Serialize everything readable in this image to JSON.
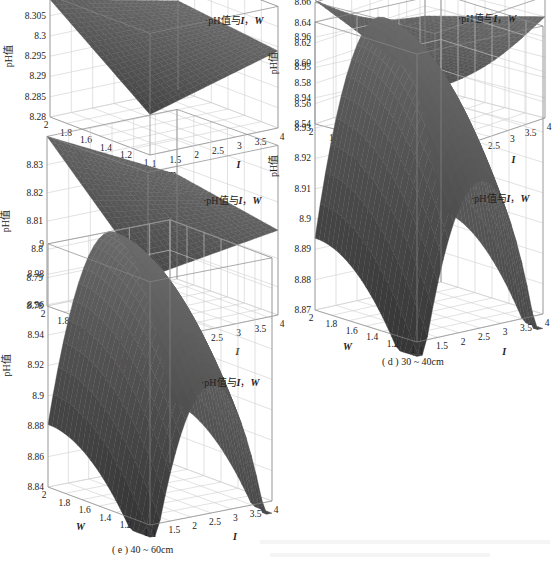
{
  "chart_data": [
    {
      "id": "a",
      "type": "surface3d",
      "caption": "( a ) 0 ~ 10cm",
      "legend": "pH值与I，W",
      "zlabel": "pH值",
      "xlabel": "I",
      "ylabel": "W",
      "x_ticks": [
        "1",
        "1.5",
        "2",
        "2.5",
        "3",
        "3.5",
        "4"
      ],
      "y_ticks": [
        "1",
        "1.2",
        "1.4",
        "1.6",
        "1.8",
        "2"
      ],
      "z_ticks": [
        "8.28",
        "8.285",
        "8.29",
        "8.295",
        "8.3",
        "8.305",
        "8.31"
      ],
      "xlim": [
        1,
        4
      ],
      "ylim": [
        1,
        2
      ],
      "zlim": [
        8.28,
        8.31
      ],
      "surface": "saddle-like, high at I=1,W=2 (~8.31), low near I=1,W=1 (~8.29), ~8.30 at I=4",
      "corner_values": {
        "I1_W2": 8.309,
        "I1_W1": 8.29,
        "I4_W2": 8.302,
        "I4_W1": 8.299
      },
      "shape": "bilinear"
    },
    {
      "id": "b",
      "type": "surface3d",
      "caption": "( b ) 10 ~ 20cm",
      "legend": "pH值与I，W",
      "zlabel": "pH值",
      "xlabel": "I",
      "ylabel": "W",
      "x_ticks": [
        "1",
        "1.5",
        "2",
        "2.5",
        "3",
        "3.5",
        "4"
      ],
      "y_ticks": [
        "1",
        "1.2",
        "1.4",
        "1.6",
        "1.8",
        "2"
      ],
      "z_ticks": [
        "8.54",
        "8.56",
        "8.58",
        "8.60",
        "8.62",
        "8.64",
        "8.66"
      ],
      "xlim": [
        1,
        4
      ],
      "ylim": [
        1,
        2
      ],
      "zlim": [
        8.54,
        8.66
      ],
      "surface": "concave trough, high at I=1,W=2 (~8.66), minimum ~8.60 near I=1,W=1, rising to ~8.64 at I=4",
      "corner_values": {
        "I1_W2": 8.662,
        "I1_W1": 8.605,
        "I4_W2": 8.61,
        "I4_W1": 8.64
      },
      "shape": "bowl"
    },
    {
      "id": "c",
      "type": "surface3d",
      "caption": "( c ) 20 ~ 30cm",
      "legend": "pH值与I，W",
      "zlabel": "pH值",
      "xlabel": "I",
      "ylabel": "W",
      "x_ticks": [
        "1",
        "1.5",
        "2",
        "2.5",
        "3",
        "3.5",
        "4"
      ],
      "y_ticks": [
        "1",
        "1.2",
        "1.4",
        "1.6",
        "1.8",
        "2"
      ],
      "z_ticks": [
        "8.78",
        "8.79",
        "8.8",
        "8.81",
        "8.82",
        "8.83"
      ],
      "xlim": [
        1,
        4
      ],
      "ylim": [
        1,
        2
      ],
      "zlim": [
        8.78,
        8.84
      ],
      "surface": "saddle-like, high at I=1,W=2 (~8.84), low ~8.80 mid, ~8.815 at I=4",
      "corner_values": {
        "I1_W2": 8.84,
        "I1_W1": 8.803,
        "I4_W2": 8.817,
        "I4_W1": 8.81
      },
      "shape": "bilinear"
    },
    {
      "id": "d",
      "type": "surface3d",
      "caption": "( d ) 30 ~ 40cm",
      "legend": "pH值与I，W",
      "zlabel": "pH值",
      "xlabel": "I",
      "ylabel": "W",
      "x_ticks": [
        "1",
        "1.5",
        "2",
        "2.5",
        "3",
        "3.5",
        "4"
      ],
      "y_ticks": [
        "1",
        "1.2",
        "1.4",
        "1.6",
        "1.8",
        "2"
      ],
      "z_ticks": [
        "8.87",
        "8.88",
        "8.89",
        "8.9",
        "8.91",
        "8.92",
        "8.93",
        "8.94",
        "8.95",
        "8.96"
      ],
      "xlim": [
        1,
        4
      ],
      "ylim": [
        1,
        2
      ],
      "zlim": [
        8.87,
        8.965
      ],
      "surface": "dome, peak ~8.96 near I=2.5,W=2; falls to ~8.87 at edges",
      "peak": 8.962,
      "edge_min": 8.87,
      "shape": "dome"
    },
    {
      "id": "e",
      "type": "surface3d",
      "caption": "( e ) 40 ~ 60cm",
      "legend": "pH值与I，W",
      "zlabel": "pH值",
      "xlabel": "I",
      "ylabel": "W",
      "x_ticks": [
        "1",
        "1.5",
        "2",
        "2.5",
        "3",
        "3.5",
        "4"
      ],
      "y_ticks": [
        "1",
        "1.2",
        "1.4",
        "1.6",
        "1.8",
        "2"
      ],
      "z_ticks": [
        "8.84",
        "8.86",
        "8.88",
        "8.9",
        "8.92",
        "8.94",
        "8.96",
        "8.98",
        "9"
      ],
      "xlim": [
        1,
        4
      ],
      "ylim": [
        1,
        2
      ],
      "zlim": [
        8.84,
        9.0
      ],
      "surface": "dome, peak ~9.0 near I=2.5,W=2; falls to ~8.84 at edges",
      "peak": 9.0,
      "edge_min": 8.84,
      "shape": "dome"
    }
  ],
  "layout": {
    "panels": [
      {
        "left": 0,
        "top": 0,
        "w": 280,
        "h": 180
      },
      {
        "left": 275,
        "top": 0,
        "w": 281,
        "h": 180
      },
      {
        "left": 0,
        "top": 180,
        "w": 280,
        "h": 190
      },
      {
        "left": 275,
        "top": 180,
        "w": 281,
        "h": 190
      },
      {
        "left": 0,
        "top": 370,
        "w": 280,
        "h": 194
      }
    ]
  },
  "colors": {
    "surface_dark": "#3a3a3a",
    "surface_mid": "#6e6e6e",
    "surface_light": "#9a9a9a",
    "grid": "#cfcfcf",
    "box": "#888888"
  }
}
